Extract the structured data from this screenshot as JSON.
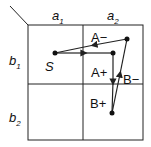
{
  "columns": [
    {
      "label": "a",
      "sub": "1"
    },
    {
      "label": "a",
      "sub": "2"
    }
  ],
  "rows": [
    {
      "label": "b",
      "sub": "1"
    },
    {
      "label": "b",
      "sub": "2"
    }
  ],
  "start_label": "S",
  "region_labels": {
    "a_minus": "A−",
    "a_plus": "A+",
    "b_minus": "B−",
    "b_plus": "B+"
  },
  "colors": {
    "line": "#222222",
    "background": "#ffffff"
  }
}
